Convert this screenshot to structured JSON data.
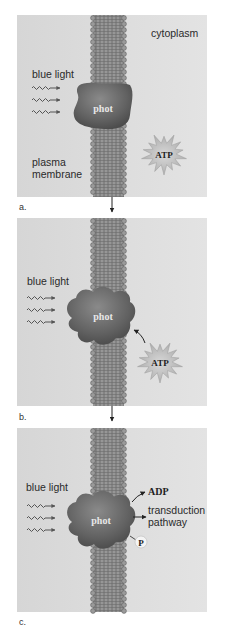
{
  "figure": {
    "panels": [
      {
        "id": "a",
        "label": "a.",
        "light_label": "blue light",
        "protein_label": "phot",
        "region_label": "cytoplasm",
        "membrane_label_line1": "plasma",
        "membrane_label_line2": "membrane",
        "atp_label": "ATP"
      },
      {
        "id": "b",
        "label": "b.",
        "light_label": "blue light",
        "protein_label": "phot",
        "atp_label": "ATP"
      },
      {
        "id": "c",
        "label": "c.",
        "light_label": "blue light",
        "protein_label": "phot",
        "adp_label": "ADP",
        "pathway_label_line1": "transduction",
        "pathway_label_line2": "pathway",
        "phosphate_label": "P"
      }
    ],
    "colors": {
      "panel_bg": "#dadada",
      "panel_bg_right": "#e4e4e4",
      "membrane": "#8c8c8c",
      "membrane_dark": "#6e6e6e",
      "protein": "#6a6a6a",
      "protein_dark": "#4a4a4a",
      "starburst": "#bdbdbd",
      "arrow": "#222222",
      "wave": "#555555"
    }
  }
}
